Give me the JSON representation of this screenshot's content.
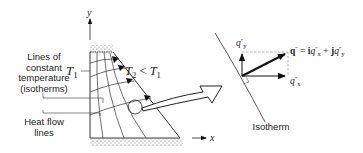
{
  "figure": {
    "left_panel": {
      "axis_y_label": "y",
      "axis_x_label": "x",
      "isotherm_label": "Lines of constant temperature (isotherms)",
      "isotherm_label_lines": [
        "Lines of",
        "constant",
        "temperature",
        "(isotherms)"
      ],
      "heat_flow_label_lines": [
        "Heat flow",
        "lines"
      ],
      "t1_label": "T",
      "t1_sub": "1",
      "t2_relation": {
        "lhs": "T",
        "lhs_sub": "2",
        "op": "<",
        "rhs": "T",
        "rhs_sub": "1"
      }
    },
    "right_panel": {
      "qy_label": "q",
      "qy_prime": "″",
      "qy_sub": "y",
      "qx_label": "q",
      "qx_prime": "″",
      "qx_sub": "x",
      "vector_equation": {
        "q": "q",
        "q_prime": "″",
        "eq": "=",
        "i": "i",
        "qx": "q",
        "qx_prime": "″",
        "qx_sub": "x",
        "plus": "+",
        "j": "j",
        "qy": "q",
        "qy_prime": "″",
        "qy_sub": "y"
      },
      "isotherm_caption": "Isotherm"
    }
  }
}
